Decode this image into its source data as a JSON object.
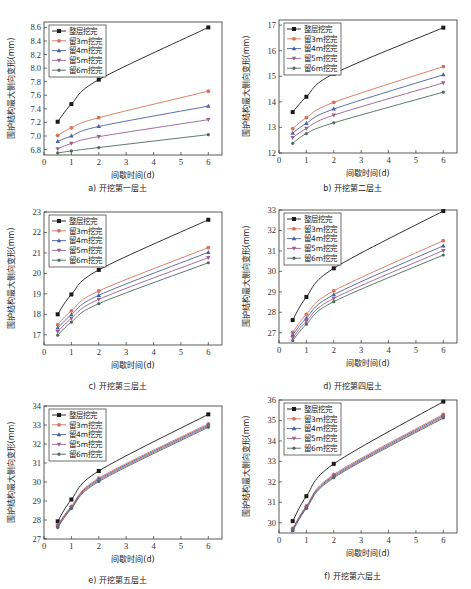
{
  "page_fragment": "",
  "series_names": [
    "整层挖完",
    "留3m挖完",
    "留4m挖完",
    "留5m挖完",
    "留6m挖完"
  ],
  "series_colors": [
    "#1a1a1a",
    "#d9705a",
    "#4a5fa8",
    "#9b5f8f",
    "#4d6b5a"
  ],
  "chart_data": [
    {
      "type": "line",
      "caption": "a) 开挖第一层土",
      "xlabel": "间歇时间(d)",
      "ylabel": "围护结构最大侧向变形(mm)",
      "xlim": [
        0,
        6.5
      ],
      "ylim": [
        6.72,
        8.68
      ],
      "xticks": [
        0,
        1,
        2,
        3,
        4,
        5,
        6
      ],
      "yticks": [
        6.8,
        7.0,
        7.2,
        7.4,
        7.6,
        7.8,
        8.0,
        8.2,
        8.4,
        8.6
      ],
      "ytick_labels": [
        "6.8",
        "7.0",
        "7.2",
        "7.4",
        "7.6",
        "7.8",
        "8.0",
        "8.2",
        "8.4",
        "8.6"
      ],
      "legend": "top-left",
      "x": [
        0.5,
        1,
        2,
        6
      ],
      "series": [
        {
          "name": "整层挖完",
          "values": [
            7.21,
            7.47,
            7.83,
            8.6
          ]
        },
        {
          "name": "留3m挖完",
          "values": [
            7.01,
            7.12,
            7.27,
            7.66
          ]
        },
        {
          "name": "留4m挖完",
          "values": [
            6.92,
            7.0,
            7.14,
            7.44
          ]
        },
        {
          "name": "留5m挖完",
          "values": [
            6.81,
            6.89,
            6.99,
            7.24
          ]
        },
        {
          "name": "留6m挖完",
          "values": [
            6.75,
            6.78,
            6.83,
            7.02
          ]
        }
      ]
    },
    {
      "type": "line",
      "caption": "b) 开挖第二层土",
      "xlabel": "间歇时间(d)",
      "ylabel": "围护结构最大侧向变形(mm)",
      "xlim": [
        0,
        6.5
      ],
      "ylim": [
        12,
        17.2
      ],
      "xticks": [
        0,
        1,
        2,
        3,
        4,
        5,
        6
      ],
      "yticks": [
        12,
        13,
        14,
        15,
        16,
        17
      ],
      "ytick_labels": [
        "12",
        "13",
        "14",
        "15",
        "16",
        "17"
      ],
      "legend": "top-left",
      "x": [
        0.5,
        1,
        2,
        6
      ],
      "series": [
        {
          "name": "整层挖完",
          "values": [
            13.6,
            14.2,
            15.1,
            16.9
          ]
        },
        {
          "name": "留3m挖完",
          "values": [
            12.95,
            13.38,
            13.98,
            15.38
          ]
        },
        {
          "name": "留4m挖完",
          "values": [
            12.78,
            13.16,
            13.72,
            15.06
          ]
        },
        {
          "name": "留5m挖完",
          "values": [
            12.6,
            12.96,
            13.48,
            14.74
          ]
        },
        {
          "name": "留6m挖完",
          "values": [
            12.38,
            12.76,
            13.18,
            14.38
          ]
        }
      ]
    },
    {
      "type": "line",
      "caption": "c) 开挖第三层土",
      "xlabel": "间歇时间(d)",
      "ylabel": "围护结构最大侧向变形(mm)",
      "xlim": [
        0,
        6.5
      ],
      "ylim": [
        16.5,
        23
      ],
      "xticks": [
        0,
        1,
        2,
        3,
        4,
        5,
        6
      ],
      "yticks": [
        17,
        18,
        19,
        20,
        21,
        22,
        23
      ],
      "ytick_labels": [
        "17",
        "18",
        "19",
        "20",
        "21",
        "22",
        "23"
      ],
      "legend": "top-left",
      "x": [
        0.5,
        1,
        2,
        6
      ],
      "series": [
        {
          "name": "整层挖完",
          "values": [
            18.0,
            18.97,
            20.17,
            22.62
          ]
        },
        {
          "name": "留3m挖完",
          "values": [
            17.5,
            18.17,
            19.14,
            21.26
          ]
        },
        {
          "name": "留4m挖完",
          "values": [
            17.33,
            17.98,
            18.93,
            21.03
          ]
        },
        {
          "name": "留5m挖完",
          "values": [
            17.15,
            17.8,
            18.73,
            20.77
          ]
        },
        {
          "name": "留6m挖完",
          "values": [
            16.98,
            17.62,
            18.52,
            20.52
          ]
        }
      ]
    },
    {
      "type": "line",
      "caption": "d) 开挖第四层土",
      "xlabel": "间歇时间(d)",
      "ylabel": "围护结构最大侧向变形(mm)",
      "xlim": [
        0,
        6.5
      ],
      "ylim": [
        26.5,
        33
      ],
      "xticks": [
        0,
        1,
        2,
        3,
        4,
        5,
        6
      ],
      "yticks": [
        27,
        28,
        29,
        30,
        31,
        32,
        33
      ],
      "ytick_labels": [
        "27",
        "28",
        "29",
        "30",
        "31",
        "32",
        "33"
      ],
      "legend": "top-left",
      "x": [
        0.5,
        1,
        2,
        6
      ],
      "series": [
        {
          "name": "整层挖完",
          "values": [
            27.62,
            28.75,
            30.15,
            32.95
          ]
        },
        {
          "name": "留3m挖完",
          "values": [
            27.02,
            27.9,
            29.05,
            31.5
          ]
        },
        {
          "name": "留4m挖完",
          "values": [
            26.9,
            27.72,
            28.86,
            31.25
          ]
        },
        {
          "name": "留5m挖完",
          "values": [
            26.76,
            27.56,
            28.68,
            31.02
          ]
        },
        {
          "name": "留6m挖完",
          "values": [
            26.62,
            27.42,
            28.52,
            30.8
          ]
        }
      ]
    },
    {
      "type": "line",
      "caption": "e) 开挖第五层土",
      "xlabel": "间歇时间(d)",
      "ylabel": "围护结构最大侧向变形(mm)",
      "xlim": [
        0,
        6.5
      ],
      "ylim": [
        27,
        34
      ],
      "xticks": [
        0,
        1,
        2,
        3,
        4,
        5,
        6
      ],
      "yticks": [
        27,
        28,
        29,
        30,
        31,
        32,
        33,
        34
      ],
      "ytick_labels": [
        "27",
        "28",
        "29",
        "30",
        "31",
        "32",
        "33",
        "34"
      ],
      "legend": "top-left",
      "x": [
        0.5,
        1,
        2,
        6
      ],
      "series": [
        {
          "name": "整层挖完",
          "values": [
            27.93,
            29.08,
            30.58,
            33.56
          ]
        },
        {
          "name": "留3m挖完",
          "values": [
            27.75,
            28.72,
            30.2,
            33.06
          ]
        },
        {
          "name": "留4m挖完",
          "values": [
            27.7,
            28.68,
            30.14,
            33.0
          ]
        },
        {
          "name": "留5m挖完",
          "values": [
            27.65,
            28.64,
            30.08,
            32.94
          ]
        },
        {
          "name": "留6m挖完",
          "values": [
            27.6,
            28.6,
            30.02,
            32.88
          ]
        }
      ]
    },
    {
      "type": "line",
      "caption": "f) 开挖第六层土",
      "xlabel": "间歇时间(d)",
      "ylabel": "围护结构最大侧向变形(mm)",
      "xlim": [
        0,
        6.5
      ],
      "ylim": [
        29.5,
        36
      ],
      "xticks": [
        0,
        1,
        2,
        3,
        4,
        5,
        6
      ],
      "yticks": [
        30,
        31,
        32,
        33,
        34,
        35,
        36
      ],
      "ytick_labels": [
        "30",
        "31",
        "32",
        "33",
        "34",
        "35",
        "36"
      ],
      "legend": "top-left",
      "x": [
        0.5,
        1,
        2,
        6
      ],
      "series": [
        {
          "name": "整层挖完",
          "values": [
            30.08,
            31.3,
            32.88,
            35.92
          ]
        },
        {
          "name": "留3m挖完",
          "values": [
            29.72,
            30.82,
            32.36,
            35.3
          ]
        },
        {
          "name": "留4m挖完",
          "values": [
            29.68,
            30.78,
            32.3,
            35.24
          ]
        },
        {
          "name": "留5m挖完",
          "values": [
            29.64,
            30.74,
            32.25,
            35.18
          ]
        },
        {
          "name": "留6m挖完",
          "values": [
            29.6,
            30.7,
            32.2,
            35.12
          ]
        }
      ]
    }
  ]
}
